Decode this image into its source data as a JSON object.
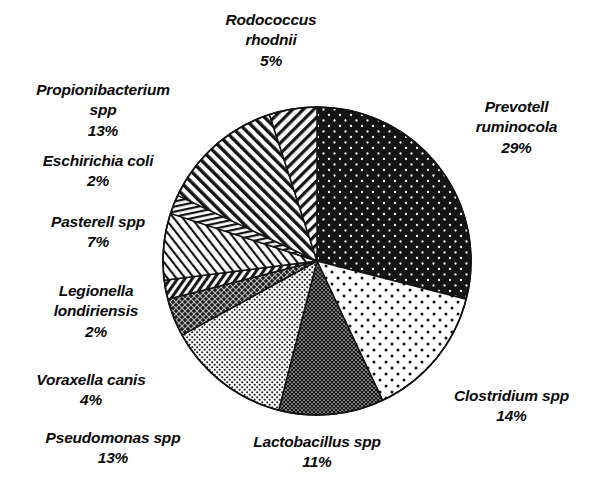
{
  "chart_data": {
    "type": "pie",
    "title": "",
    "subtitle": "",
    "xlabel": "",
    "ylabel": "",
    "legend_position": "none",
    "grid": false,
    "start_angle_deg": 0,
    "direction": "clockwise",
    "units": "percent",
    "total": 100,
    "categories": [
      "Prevotell ruminocola",
      "Clostridium spp",
      "Lactobacillus spp",
      "Pseudomonas spp",
      "Voraxella canis",
      "Legionella londiriensis",
      "Pasterell spp",
      "Eschirichia coli",
      "Propionibacterium spp",
      "Rodococcus rhodnii"
    ],
    "values": [
      29,
      14,
      11,
      13,
      4,
      2,
      7,
      2,
      13,
      5
    ],
    "value_labels": [
      "29%",
      "14%",
      "11%",
      "13%",
      "4%",
      "2%",
      "7%",
      "2%",
      "13%",
      "5%"
    ],
    "slices": [
      {
        "name": "Prevotell ruminocola",
        "value": 29,
        "value_label": "29%",
        "pattern": "black-with-white-dots"
      },
      {
        "name": "Clostridium spp",
        "value": 14,
        "value_label": "14%",
        "pattern": "white-with-sparse-black-dots"
      },
      {
        "name": "Lactobacillus spp",
        "value": 11,
        "value_label": "11%",
        "pattern": "dense-dark-dots"
      },
      {
        "name": "Pseudomonas spp",
        "value": 13,
        "value_label": "13%",
        "pattern": "fine-light-dots"
      },
      {
        "name": "Voraxella canis",
        "value": 4,
        "value_label": "4%",
        "pattern": "dark-crosshatch"
      },
      {
        "name": "Legionella londiriensis",
        "value": 2,
        "value_label": "2%",
        "pattern": "narrow-dark-diagonal"
      },
      {
        "name": "Pasterell spp",
        "value": 7,
        "value_label": "7%",
        "pattern": "light-diagonal-stripes"
      },
      {
        "name": "Eschirichia coli",
        "value": 2,
        "value_label": "2%",
        "pattern": "thin-vertical-stripes"
      },
      {
        "name": "Propionibacterium spp",
        "value": 13,
        "value_label": "13%",
        "pattern": "forward-diagonal-stripes"
      },
      {
        "name": "Rodococcus rhodnii",
        "value": 5,
        "value_label": "5%",
        "pattern": "back-diagonal-stripes"
      }
    ]
  },
  "labels": {
    "rodococcus": {
      "l1": "Rodococcus",
      "l2": "rhodnii",
      "l3": "5%"
    },
    "propionibacterium": {
      "l1": "Propionibacterium",
      "l2": "spp",
      "l3": "13%"
    },
    "eschirichia": {
      "l1": "Eschirichia coli",
      "l2": "2%"
    },
    "pasterell": {
      "l1": "Pasterell spp",
      "l2": "7%"
    },
    "legionella": {
      "l1": "Legionella",
      "l2": "londiriensis",
      "l3": "2%"
    },
    "voraxella": {
      "l1": "Voraxella canis",
      "l2": "4%"
    },
    "pseudomonas": {
      "l1": "Pseudomonas spp",
      "l2": "13%"
    },
    "lactobacillus": {
      "l1": "Lactobacillus spp",
      "l2": "11%"
    },
    "clostridium": {
      "l1": "Clostridium spp",
      "l2": "14%"
    },
    "prevotell": {
      "l1": "Prevotell",
      "l2": "ruminocola",
      "l3": "29%"
    }
  },
  "colors": {
    "background": "#ffffff",
    "ink": "#0a0a0a",
    "outline": "#111111",
    "fill_black": "#141414",
    "fill_white": "#ffffff"
  }
}
